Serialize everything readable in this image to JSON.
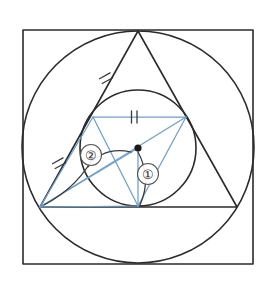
{
  "figure": {
    "canvas": {
      "width": 270,
      "height": 288,
      "background": "#ffffff"
    },
    "colors": {
      "outline": "#2b2b2b",
      "accent_blue": "#6c9fd0",
      "tick": "#3a3a3a",
      "center_dot": "#1a1a1a",
      "label_stroke": "#555555"
    },
    "square": {
      "name": "bounding-square",
      "x": 23,
      "y": 30,
      "width": 230,
      "height": 234
    },
    "outer_circle": {
      "name": "circumscribed-circle",
      "cx": 138,
      "cy": 147,
      "r": 116
    },
    "inner_circle": {
      "name": "inscribed-circle",
      "cx": 138,
      "cy": 148,
      "r": 58
    },
    "triangle": {
      "name": "equilateral-triangle",
      "vertices": [
        {
          "label": "apex",
          "x": 138,
          "y": 31
        },
        {
          "label": "bottom-left",
          "x": 40,
          "y": 207
        },
        {
          "label": "bottom-right",
          "x": 237,
          "y": 207
        }
      ]
    },
    "inner_triangle": {
      "name": "blue-inscribed-triangle",
      "vertices": [
        {
          "label": "chord-left",
          "x": 93,
          "y": 117
        },
        {
          "label": "chord-right",
          "x": 186,
          "y": 117
        },
        {
          "label": "tangent-point-bottom",
          "x": 138,
          "y": 206
        }
      ]
    },
    "center_point": {
      "name": "incenter",
      "x": 138,
      "y": 148,
      "r": 3.6
    },
    "blue_segments": [
      {
        "name": "chord-top",
        "x1": 93,
        "y1": 117,
        "x2": 186,
        "y2": 117
      },
      {
        "name": "chord-left-side",
        "x1": 93,
        "y1": 117,
        "x2": 138,
        "y2": 206
      },
      {
        "name": "chord-right-side",
        "x1": 186,
        "y1": 117,
        "x2": 138,
        "y2": 206
      },
      {
        "name": "radius-to-bottom",
        "x1": 138,
        "y1": 148,
        "x2": 138,
        "y2": 206
      },
      {
        "name": "vertex-to-center",
        "x1": 40,
        "y1": 207,
        "x2": 138,
        "y2": 148
      },
      {
        "name": "vertex-to-chord-right",
        "x1": 40,
        "y1": 207,
        "x2": 186,
        "y2": 117
      },
      {
        "name": "vertex-to-tangent-bottom",
        "x1": 40,
        "y1": 207,
        "x2": 138,
        "y2": 206
      },
      {
        "name": "vertex-to-chord-left",
        "x1": 40,
        "y1": 207,
        "x2": 93,
        "y2": 117
      }
    ],
    "angle_arcs": [
      {
        "name": "angle-arc-one",
        "path": "M 138 152 Q 152 178 140 205",
        "description": "arc at incenter opening toward base tangent point"
      },
      {
        "name": "angle-arc-two",
        "path": "M 131 152 Q 103 146 88 167",
        "description": "arc at incenter opening toward bottom-left vertex"
      },
      {
        "name": "angle-arc-two-outer",
        "path": "M 44 205 Q 80 186 96 152",
        "description": "arc at bottom-left vertex between side and cevian"
      }
    ],
    "tick_marks": [
      {
        "name": "tick-upper-left-side",
        "count": 2,
        "position": {
          "x": 106,
          "y": 78
        },
        "angle_deg": 61
      },
      {
        "name": "tick-lower-left-side",
        "count": 2,
        "position": {
          "x": 59,
          "y": 163
        },
        "angle_deg": 61
      },
      {
        "name": "tick-blue-chord-top",
        "count": 2,
        "position": {
          "x": 134,
          "y": 117
        },
        "angle_deg": 0
      }
    ],
    "labels": [
      {
        "name": "angle-label-one",
        "text": "①",
        "plain": "1",
        "cx": 148,
        "cy": 174,
        "r": 10.5
      },
      {
        "name": "angle-label-two",
        "text": "②",
        "plain": "2",
        "cx": 91,
        "cy": 155,
        "r": 10.5
      }
    ]
  }
}
